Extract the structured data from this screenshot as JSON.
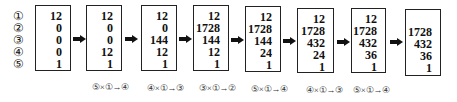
{
  "row_labels": [
    "①",
    "②",
    "③",
    "④",
    "⑤"
  ],
  "boxes": [
    {
      "values": [
        "12",
        "0",
        "0",
        "0",
        "1"
      ]
    },
    {
      "values": [
        "12",
        "0",
        "0",
        "12",
        "1"
      ]
    },
    {
      "values": [
        "12",
        "0",
        "144",
        "12",
        "1"
      ]
    },
    {
      "values": [
        "12",
        "1728",
        "144",
        "12",
        "1"
      ]
    },
    {
      "values": [
        "12",
        "1728",
        "144",
        "24",
        "1"
      ]
    },
    {
      "values": [
        "12",
        "1728",
        "432",
        "24",
        "1"
      ]
    },
    {
      "values": [
        "12",
        "1728",
        "432",
        "36",
        "1"
      ]
    },
    {
      "values": [
        "1728",
        "432",
        "36",
        "1"
      ]
    }
  ],
  "operations": [
    "⑤×①→④",
    "④×①→③",
    "③×①→②",
    "⑤×①→④",
    "④×①→③",
    "⑤×①→④"
  ]
}
